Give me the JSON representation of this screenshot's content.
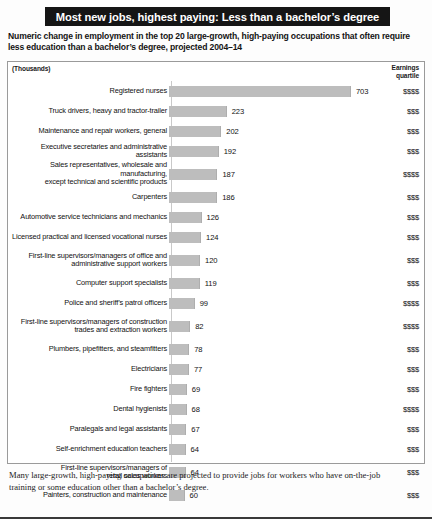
{
  "title": "Most new jobs, highest paying: Less than a bachelor’s degree",
  "subtitle": "Numeric change in employment in the top 20 large-growth, high-paying occupations that often require less education than a bachelor’s degree, projected 2004–14",
  "units_label": "(Thousands)",
  "earnings_header_line1": "Earnings",
  "earnings_header_line2": "quartile",
  "footnote": "Many large-growth, high-paying occupations are projected to provide jobs for workers who have on-the-job training or some education other than a bachelor’s degree.",
  "colors": {
    "bar": "#bdbdbd",
    "title_background": "#151515",
    "title_text": "#ffffff",
    "panel_border": "#9a9a9a",
    "baseline": "#c9c9c9"
  },
  "chart_data": {
    "type": "bar",
    "orientation": "horizontal",
    "title": "Most new jobs, highest paying: Less than a bachelor’s degree",
    "subtitle": "Numeric change in employment in the top 20 large-growth, high-paying occupations that often require less education than a bachelor’s degree, projected 2004–14",
    "xlabel": "(Thousands)",
    "ylabel": "",
    "xlim": [
      0,
      703
    ],
    "grid": false,
    "legend": "none",
    "value_unit": "thousands",
    "categories": [
      "Registered nurses",
      "Truck drivers, heavy and tractor-trailer",
      "Maintenance and repair workers, general",
      "Executive secretaries and administrative assistants",
      "Sales representatives, wholesale and manufacturing,\nexcept technical and scientific products",
      "Carpenters",
      "Automotive service technicians and mechanics",
      "Licensed practical and licensed vocational nurses",
      "First-line supervisors/managers of office and\nadministrative support workers",
      "Computer support specialists",
      "Police and sheriff’s patrol officers",
      "First-line supervisors/managers of construction\ntrades and extraction workers",
      "Plumbers, pipefitters, and steamfitters",
      "Electricians",
      "Fire fighters",
      "Dental hygienists",
      "Paralegals and legal assistants",
      "Self-enrichment education teachers",
      "First-line supervisors/managers of\nretail sales workers",
      "Painters, construction and maintenance"
    ],
    "values": [
      703,
      223,
      202,
      192,
      187,
      186,
      126,
      124,
      120,
      119,
      99,
      82,
      78,
      77,
      69,
      68,
      67,
      64,
      64,
      60
    ],
    "quartiles": [
      "$$$$",
      "$$$",
      "$$$",
      "$$$",
      "$$$$",
      "$$$",
      "$$$",
      "$$$",
      "$$$",
      "$$$",
      "$$$$",
      "$$$$",
      "$$$",
      "$$$",
      "$$$",
      "$$$$",
      "$$$",
      "$$$",
      "$$$",
      "$$$"
    ],
    "two_line_rows": [
      4,
      8,
      11,
      18
    ]
  }
}
